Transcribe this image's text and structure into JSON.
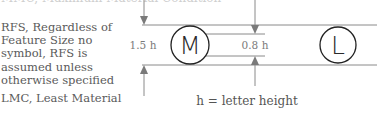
{
  "text_column": {
    "cutoff_line": "MMC, Maximum Material Condition",
    "rfs_description": "RFS, Regardless of Feature Size no symbol, RFS is assumed unless otherwise specified",
    "lmc_label": "LMC, Least Material"
  },
  "diagram": {
    "symbol_mmc": "M",
    "symbol_lmc": "L",
    "outer_dimension": "1.5 h",
    "inner_dimension": "0.8 h",
    "legend_note": "h = letter height"
  }
}
